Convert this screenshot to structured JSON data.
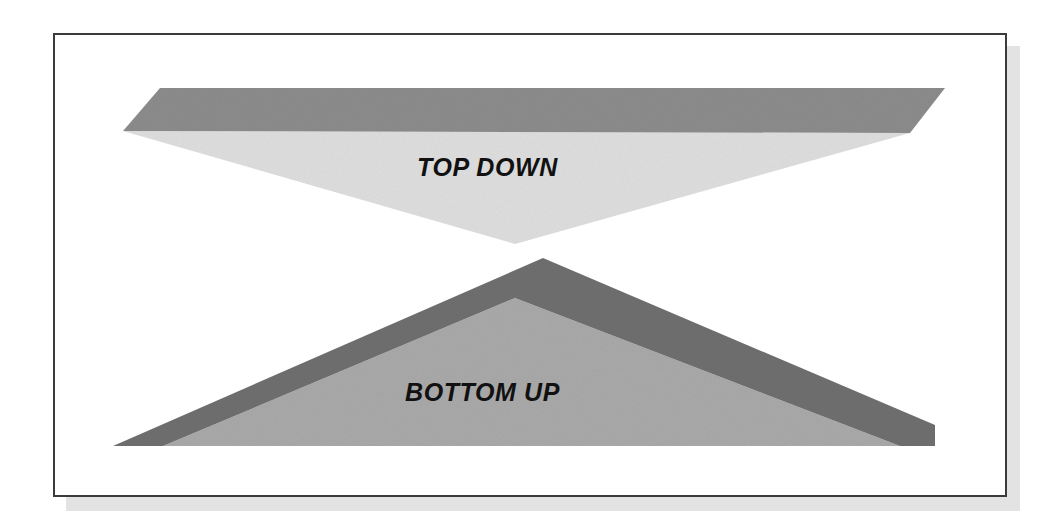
{
  "figure": {
    "kind": "two-opposing-arrow-diagram",
    "background_color": "#ffffff",
    "frame": {
      "border_color": "#3b3b3b",
      "fill_color": "#ffffff",
      "shadow_color": "#e3e3e3"
    },
    "arrows": [
      {
        "id": "top-down-arrow",
        "label": "TOP DOWN",
        "direction": "downward",
        "face_color": "#dedede",
        "bevel_color": "#8c8c8c",
        "label_color": "#111111"
      },
      {
        "id": "bottom-up-arrow",
        "label": "BOTTOM UP",
        "direction": "upward",
        "face_color": "#a9a9a9",
        "bevel_color": "#6f6f6f",
        "label_color": "#111111"
      }
    ]
  },
  "labels": {
    "top_down": "TOP DOWN",
    "bottom_up": "BOTTOM UP"
  }
}
